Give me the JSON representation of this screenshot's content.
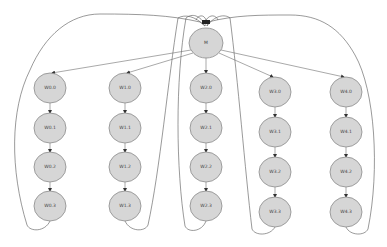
{
  "diagram": {
    "type": "directed-graph",
    "colors": {
      "node_fill": "#d6d6d6",
      "node_stroke": "#8a8a8a",
      "edge": "#6f6f6f",
      "label": "#444444",
      "background": "#ffffff"
    },
    "master": {
      "id": "M",
      "label": "M",
      "cx": 206,
      "cy": 43,
      "rx": 17,
      "ry": 15
    },
    "columns": [
      {
        "id": "col0",
        "x": 50,
        "ys": [
          88,
          128,
          167,
          206
        ],
        "labels": [
          "W0.0",
          "W0.1",
          "W0.2",
          "W0.3"
        ]
      },
      {
        "id": "col1",
        "x": 125,
        "ys": [
          88,
          128,
          167,
          206
        ],
        "labels": [
          "W1.0",
          "W1.1",
          "W1.2",
          "W1.3"
        ]
      },
      {
        "id": "col2",
        "x": 206,
        "ys": [
          88,
          128,
          167,
          206
        ],
        "labels": [
          "W2.0",
          "W2.1",
          "W2.2",
          "W2.3"
        ]
      },
      {
        "id": "col3",
        "x": 275,
        "ys": [
          92,
          132,
          172,
          212
        ],
        "labels": [
          "W3.0",
          "W3.1",
          "W3.2",
          "W3.3"
        ]
      },
      {
        "id": "col4",
        "x": 346,
        "ys": [
          92,
          132,
          172,
          212
        ],
        "labels": [
          "W4.0",
          "W4.1",
          "W4.2",
          "W4.3"
        ]
      }
    ],
    "edges_description": "M points to the first node of each column; nodes in each column are chained top-to-bottom; the last node of each column loops back to M via a curved edge.",
    "node_radius": {
      "rx": 16,
      "ry": 15
    }
  }
}
